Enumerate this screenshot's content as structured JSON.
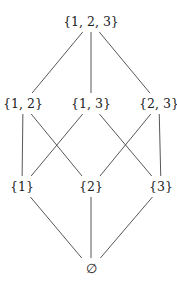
{
  "diagram": {
    "type": "hasse-diagram",
    "nodes": [
      {
        "id": "123",
        "label": "{1, 2, 3}",
        "level": 3
      },
      {
        "id": "12",
        "label": "{1, 2}",
        "level": 2
      },
      {
        "id": "13",
        "label": "{1, 3}",
        "level": 2
      },
      {
        "id": "23",
        "label": "{2, 3}",
        "level": 2
      },
      {
        "id": "1",
        "label": "{1}",
        "level": 1
      },
      {
        "id": "2",
        "label": "{2}",
        "level": 1
      },
      {
        "id": "3",
        "label": "{3}",
        "level": 1
      },
      {
        "id": "empty",
        "label": "∅",
        "level": 0
      }
    ],
    "edges": [
      [
        "123",
        "12"
      ],
      [
        "123",
        "13"
      ],
      [
        "123",
        "23"
      ],
      [
        "12",
        "1"
      ],
      [
        "12",
        "2"
      ],
      [
        "13",
        "1"
      ],
      [
        "13",
        "3"
      ],
      [
        "23",
        "2"
      ],
      [
        "23",
        "3"
      ],
      [
        "1",
        "empty"
      ],
      [
        "2",
        "empty"
      ],
      [
        "3",
        "empty"
      ]
    ]
  }
}
